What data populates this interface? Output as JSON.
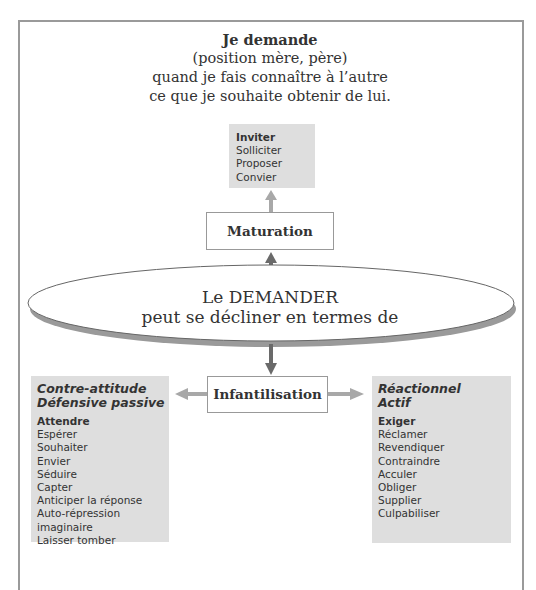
{
  "header": {
    "title": "Je demande",
    "subtitle_lines": [
      "(position mère, père)",
      "quand je fais connaître à l’autre",
      "ce que je souhaite obtenir de lui."
    ]
  },
  "top_box": {
    "items": [
      "Inviter",
      "Solliciter",
      "Proposer",
      "Convier"
    ]
  },
  "maturation_box": {
    "label": "Maturation"
  },
  "center_ellipse": {
    "line1": "Le DEMANDER",
    "line2": "peut se décliner en termes de"
  },
  "infantilisation_box": {
    "label": "Infantilisation"
  },
  "left_box": {
    "heading_lines": [
      "Contre-attitude",
      "Défensive passive"
    ],
    "items": [
      "Attendre",
      "Espérer",
      "Souhaiter",
      "Envier",
      "Séduire",
      "Capter",
      "Anticiper la réponse",
      "Auto-répression imaginaire",
      "Laisser tomber"
    ]
  },
  "right_box": {
    "heading_lines": [
      "Réactionnel",
      "Actif"
    ],
    "items": [
      "Exiger",
      "Réclamer",
      "Revendiquer",
      "Contraindre",
      "Acculer",
      "Obliger",
      "Supplier",
      "Culpabiliser"
    ]
  },
  "colors": {
    "frame": "#9a9a9a",
    "gray_box": "#dedede",
    "arrow_light": "#a8a8a8",
    "arrow_dark": "#6a6a6a",
    "ellipse_shadow": "#9a9a9a",
    "text": "#333333"
  }
}
